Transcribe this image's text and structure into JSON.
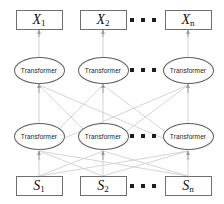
{
  "diagram": {
    "colors": {
      "box_border": "#6f6f6f",
      "ellipse_border": "#5d5d5d",
      "edge": "#cfcfcf",
      "arrow": "#9a9a9a",
      "text": "#111111",
      "background": "#ffffff"
    },
    "rows": [
      {
        "id": "outputs",
        "kind": "box",
        "nodes": [
          {
            "symbol": "X",
            "subscript": "1"
          },
          {
            "symbol": "X",
            "subscript": "2"
          },
          {
            "symbol": "X",
            "subscript": "n"
          }
        ]
      },
      {
        "id": "transformer-layer-2",
        "kind": "ellipse",
        "nodes": [
          {
            "label": "Transformer"
          },
          {
            "label": "Transformer"
          },
          {
            "label": "Transformer"
          }
        ]
      },
      {
        "id": "transformer-layer-1",
        "kind": "ellipse",
        "nodes": [
          {
            "label": "Transformer"
          },
          {
            "label": "Transformer"
          },
          {
            "label": "Transformer"
          }
        ]
      },
      {
        "id": "inputs",
        "kind": "box",
        "nodes": [
          {
            "symbol": "S",
            "subscript": "1"
          },
          {
            "symbol": "S",
            "subscript": "2"
          },
          {
            "symbol": "S",
            "subscript": "n"
          }
        ]
      }
    ],
    "ellipsis": {
      "glyph": "■",
      "count": 3,
      "meaning": "continuation"
    }
  }
}
